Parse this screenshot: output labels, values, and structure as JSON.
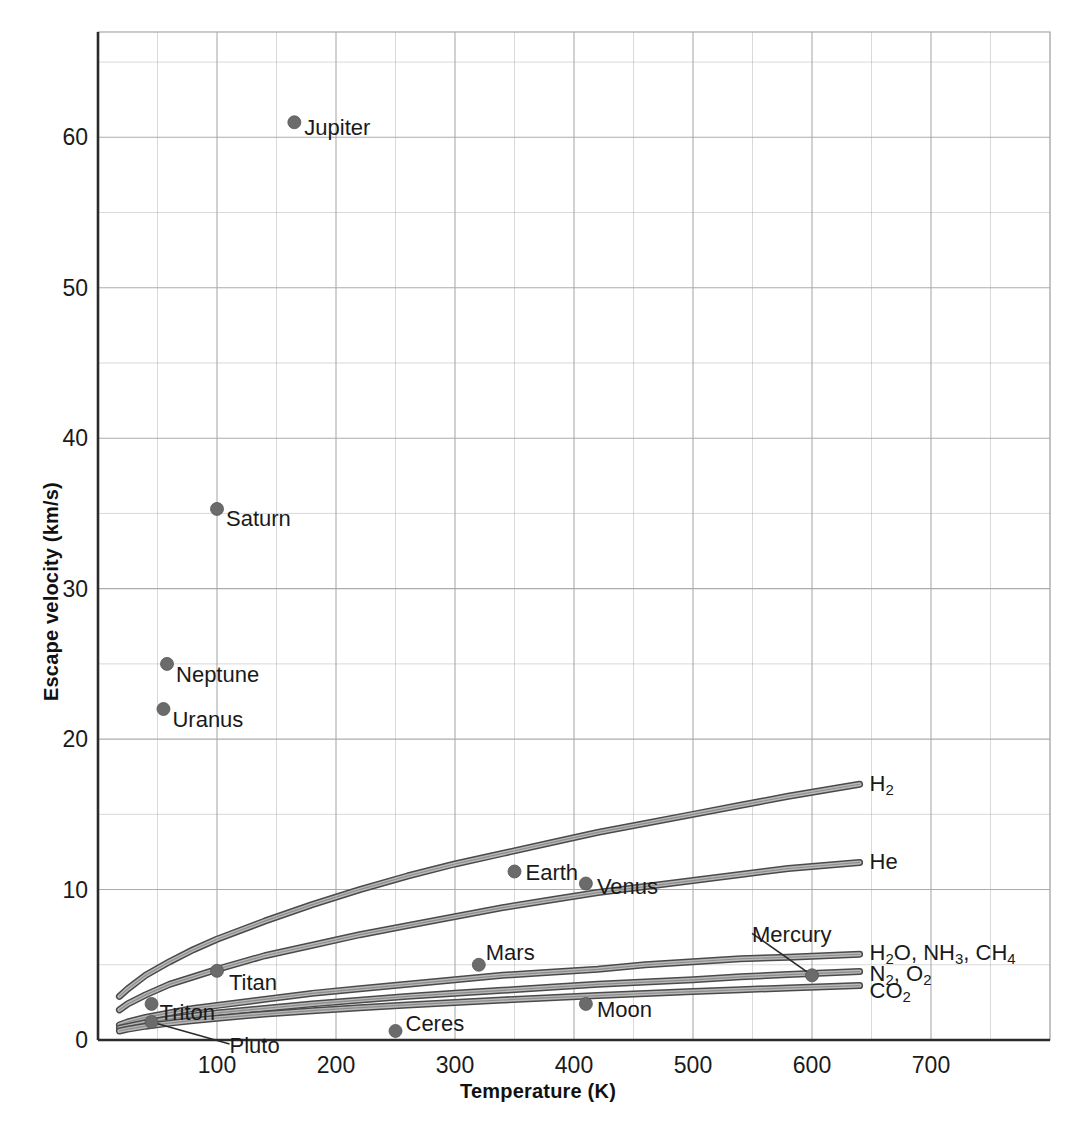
{
  "chart_data": {
    "type": "scatter",
    "title": "",
    "xlabel": "Temperature (K)",
    "ylabel": "Escape velocity (km/s)",
    "xlim": [
      0,
      800
    ],
    "ylim": [
      0,
      67
    ],
    "xticks": [
      100,
      200,
      300,
      400,
      500,
      600,
      700
    ],
    "yticks": [
      0,
      10,
      20,
      30,
      40,
      50,
      60
    ],
    "x_minor_step": 50,
    "y_minor_step": 5,
    "grid": true,
    "legend_position": "inline-right-labels",
    "points": [
      {
        "name": "Jupiter",
        "x": 165,
        "y": 61.0,
        "label_dx": 10,
        "label_dy": 4,
        "leader": false
      },
      {
        "name": "Saturn",
        "x": 100,
        "y": 35.3,
        "label_dx": 9,
        "label_dy": 8,
        "leader": false
      },
      {
        "name": "Neptune",
        "x": 58,
        "y": 25.0,
        "label_dx": 9,
        "label_dy": 9,
        "leader": false
      },
      {
        "name": "Uranus",
        "x": 55,
        "y": 22.0,
        "label_dx": 9,
        "label_dy": 9,
        "leader": false
      },
      {
        "name": "Earth",
        "x": 350,
        "y": 11.2,
        "label_dx": 11,
        "label_dy": 0,
        "leader": false
      },
      {
        "name": "Venus",
        "x": 410,
        "y": 10.4,
        "label_dx": 11,
        "label_dy": 1,
        "leader": false
      },
      {
        "name": "Mars",
        "x": 320,
        "y": 5.0,
        "label_dx": 7,
        "label_dy": -14,
        "leader": false
      },
      {
        "name": "Mercury",
        "x": 600,
        "y": 4.3,
        "label_dx": -60,
        "label_dy": -42,
        "leader": true
      },
      {
        "name": "Moon",
        "x": 410,
        "y": 2.4,
        "label_dx": 11,
        "label_dy": 4,
        "leader": false
      },
      {
        "name": "Titan",
        "x": 100,
        "y": 4.6,
        "label_dx": 12,
        "label_dy": 10,
        "leader": false
      },
      {
        "name": "Triton",
        "x": 45,
        "y": 2.4,
        "label_dx": 8,
        "label_dy": 7,
        "leader": false
      },
      {
        "name": "Pluto",
        "x": 45,
        "y": 1.2,
        "label_dx": 78,
        "label_dy": 22,
        "leader": true
      },
      {
        "name": "Ceres",
        "x": 250,
        "y": 0.6,
        "label_dx": 10,
        "label_dy": -9,
        "leader": false
      }
    ],
    "series": [
      {
        "name": "H2",
        "label": "H₂",
        "molar_mass": 2,
        "x": [
          18,
          25,
          40,
          60,
          80,
          100,
          140,
          180,
          220,
          260,
          300,
          340,
          380,
          420,
          460,
          500,
          540,
          580,
          610,
          640
        ],
        "y": [
          2.9,
          3.4,
          4.3,
          5.2,
          6.0,
          6.7,
          7.9,
          9.0,
          10.0,
          10.9,
          11.7,
          12.4,
          13.1,
          13.8,
          14.4,
          15.0,
          15.6,
          16.2,
          16.6,
          17.0
        ]
      },
      {
        "name": "He",
        "label": "He",
        "molar_mass": 4,
        "x": [
          18,
          25,
          40,
          60,
          80,
          100,
          140,
          180,
          220,
          260,
          300,
          340,
          380,
          420,
          460,
          500,
          540,
          580,
          610,
          640
        ],
        "y": [
          2.0,
          2.4,
          3.0,
          3.7,
          4.2,
          4.7,
          5.6,
          6.3,
          7.0,
          7.6,
          8.2,
          8.8,
          9.3,
          9.8,
          10.2,
          10.6,
          11.0,
          11.4,
          11.6,
          11.8
        ]
      },
      {
        "name": "H2O, NH3, CH4",
        "label": "H₂O, NH₃, CH₄",
        "molar_mass": 17,
        "x": [
          18,
          25,
          40,
          60,
          80,
          100,
          140,
          180,
          220,
          260,
          300,
          340,
          380,
          420,
          460,
          500,
          540,
          580,
          610,
          640
        ],
        "y": [
          1.0,
          1.2,
          1.5,
          1.8,
          2.1,
          2.3,
          2.7,
          3.1,
          3.4,
          3.7,
          4.0,
          4.3,
          4.5,
          4.7,
          5.0,
          5.2,
          5.4,
          5.5,
          5.6,
          5.7
        ]
      },
      {
        "name": "N2, O2",
        "label": "N₂, O₂",
        "molar_mass": 30,
        "x": [
          18,
          25,
          40,
          60,
          80,
          100,
          140,
          180,
          220,
          260,
          300,
          340,
          380,
          420,
          460,
          500,
          540,
          580,
          610,
          640
        ],
        "y": [
          0.78,
          0.9,
          1.15,
          1.4,
          1.6,
          1.8,
          2.1,
          2.4,
          2.65,
          2.9,
          3.1,
          3.3,
          3.5,
          3.7,
          3.85,
          4.0,
          4.2,
          4.35,
          4.45,
          4.55
        ]
      },
      {
        "name": "CO2",
        "label": "CO₂",
        "molar_mass": 44,
        "x": [
          18,
          25,
          40,
          60,
          80,
          100,
          140,
          180,
          220,
          260,
          300,
          340,
          380,
          420,
          460,
          500,
          540,
          580,
          610,
          640
        ],
        "y": [
          0.6,
          0.72,
          0.92,
          1.12,
          1.3,
          1.45,
          1.72,
          1.95,
          2.15,
          2.33,
          2.5,
          2.66,
          2.81,
          2.95,
          3.09,
          3.22,
          3.34,
          3.46,
          3.54,
          3.62
        ]
      }
    ],
    "colors": {
      "point": "#6b6b6b",
      "curve_stroke": "#4a4a4a",
      "curve_fill": "#b9b9b9",
      "grid": "#a8a8a8",
      "axis": "#2b2b2b",
      "text": "#1a1a1a"
    }
  }
}
